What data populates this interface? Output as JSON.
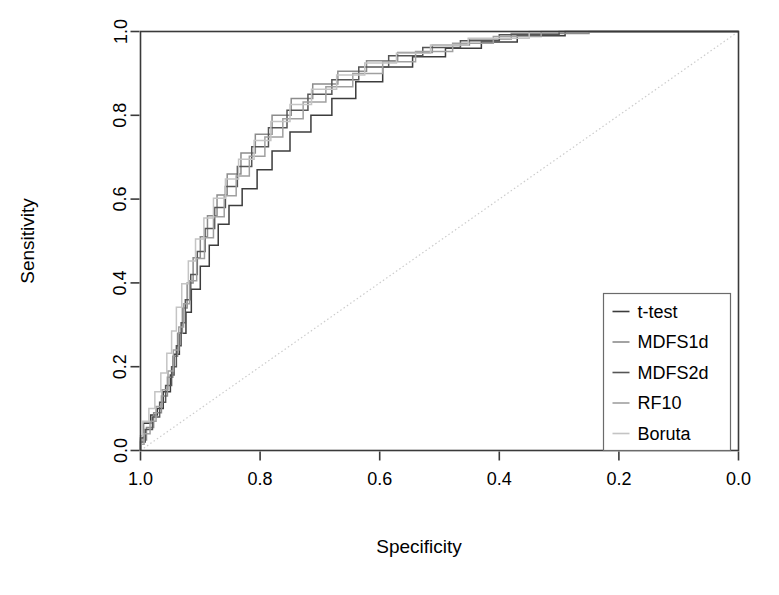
{
  "chart_data": {
    "type": "line",
    "title": "",
    "subtitle": "",
    "xlabel": "Specificity",
    "ylabel": "Sensitivity",
    "xlim": [
      1.0,
      0.0
    ],
    "ylim": [
      0.0,
      1.0
    ],
    "x_reversed": true,
    "grid": false,
    "legend_position": "bottom-right",
    "xticks": [
      "1.0",
      "0.8",
      "0.6",
      "0.4",
      "0.2",
      "0.0"
    ],
    "xtick_values": [
      1.0,
      0.8,
      0.6,
      0.4,
      0.2,
      0.0
    ],
    "yticks": [
      "0.0",
      "0.2",
      "0.4",
      "0.6",
      "0.8",
      "1.0"
    ],
    "ytick_values": [
      0.0,
      0.2,
      0.4,
      0.6,
      0.8,
      1.0
    ],
    "reference_line": {
      "name": "chance-diagonal",
      "from": [
        1.0,
        0.0
      ],
      "to": [
        0.0,
        1.0
      ],
      "style": "dotted",
      "color": "#cccccc"
    },
    "annotations": [],
    "series": [
      {
        "name": "t-test",
        "color": "#3c3c3c",
        "style": "step",
        "points": [
          [
            1.0,
            0.0
          ],
          [
            1.0,
            0.03
          ],
          [
            0.995,
            0.03
          ],
          [
            0.995,
            0.065
          ],
          [
            0.983,
            0.065
          ],
          [
            0.983,
            0.085
          ],
          [
            0.972,
            0.085
          ],
          [
            0.972,
            0.1
          ],
          [
            0.962,
            0.1
          ],
          [
            0.962,
            0.14
          ],
          [
            0.95,
            0.14
          ],
          [
            0.95,
            0.18
          ],
          [
            0.944,
            0.18
          ],
          [
            0.944,
            0.23
          ],
          [
            0.935,
            0.23
          ],
          [
            0.935,
            0.28
          ],
          [
            0.924,
            0.28
          ],
          [
            0.924,
            0.33
          ],
          [
            0.915,
            0.33
          ],
          [
            0.915,
            0.385
          ],
          [
            0.9,
            0.385
          ],
          [
            0.9,
            0.44
          ],
          [
            0.885,
            0.44
          ],
          [
            0.885,
            0.49
          ],
          [
            0.87,
            0.49
          ],
          [
            0.87,
            0.54
          ],
          [
            0.852,
            0.54
          ],
          [
            0.852,
            0.585
          ],
          [
            0.83,
            0.585
          ],
          [
            0.83,
            0.625
          ],
          [
            0.805,
            0.625
          ],
          [
            0.805,
            0.67
          ],
          [
            0.78,
            0.67
          ],
          [
            0.78,
            0.715
          ],
          [
            0.75,
            0.715
          ],
          [
            0.75,
            0.76
          ],
          [
            0.715,
            0.76
          ],
          [
            0.715,
            0.8
          ],
          [
            0.68,
            0.8
          ],
          [
            0.68,
            0.84
          ],
          [
            0.64,
            0.84
          ],
          [
            0.64,
            0.88
          ],
          [
            0.595,
            0.88
          ],
          [
            0.595,
            0.915
          ],
          [
            0.545,
            0.915
          ],
          [
            0.545,
            0.94
          ],
          [
            0.49,
            0.94
          ],
          [
            0.49,
            0.96
          ],
          [
            0.43,
            0.96
          ],
          [
            0.43,
            0.975
          ],
          [
            0.37,
            0.975
          ],
          [
            0.37,
            0.99
          ],
          [
            0.29,
            0.99
          ],
          [
            0.29,
            1.0
          ],
          [
            0.0,
            1.0
          ]
        ]
      },
      {
        "name": "MDFS1d",
        "color": "#8c8c8c",
        "style": "step",
        "points": [
          [
            1.0,
            0.0
          ],
          [
            1.0,
            0.025
          ],
          [
            0.99,
            0.025
          ],
          [
            0.99,
            0.055
          ],
          [
            0.978,
            0.055
          ],
          [
            0.978,
            0.09
          ],
          [
            0.965,
            0.09
          ],
          [
            0.965,
            0.13
          ],
          [
            0.955,
            0.13
          ],
          [
            0.955,
            0.175
          ],
          [
            0.946,
            0.175
          ],
          [
            0.946,
            0.225
          ],
          [
            0.938,
            0.225
          ],
          [
            0.938,
            0.28
          ],
          [
            0.93,
            0.28
          ],
          [
            0.93,
            0.34
          ],
          [
            0.922,
            0.34
          ],
          [
            0.922,
            0.4
          ],
          [
            0.912,
            0.4
          ],
          [
            0.912,
            0.46
          ],
          [
            0.9,
            0.46
          ],
          [
            0.9,
            0.51
          ],
          [
            0.888,
            0.51
          ],
          [
            0.888,
            0.56
          ],
          [
            0.872,
            0.56
          ],
          [
            0.872,
            0.61
          ],
          [
            0.855,
            0.61
          ],
          [
            0.855,
            0.66
          ],
          [
            0.832,
            0.66
          ],
          [
            0.832,
            0.71
          ],
          [
            0.808,
            0.71
          ],
          [
            0.808,
            0.755
          ],
          [
            0.78,
            0.755
          ],
          [
            0.78,
            0.8
          ],
          [
            0.748,
            0.8
          ],
          [
            0.748,
            0.84
          ],
          [
            0.712,
            0.84
          ],
          [
            0.712,
            0.875
          ],
          [
            0.67,
            0.875
          ],
          [
            0.67,
            0.905
          ],
          [
            0.622,
            0.905
          ],
          [
            0.622,
            0.93
          ],
          [
            0.57,
            0.93
          ],
          [
            0.57,
            0.95
          ],
          [
            0.512,
            0.95
          ],
          [
            0.512,
            0.968
          ],
          [
            0.45,
            0.968
          ],
          [
            0.45,
            0.982
          ],
          [
            0.38,
            0.982
          ],
          [
            0.38,
            0.995
          ],
          [
            0.25,
            0.995
          ],
          [
            0.25,
            1.0
          ],
          [
            0.0,
            1.0
          ]
        ]
      },
      {
        "name": "MDFS2d",
        "color": "#555555",
        "style": "step",
        "points": [
          [
            1.0,
            0.0
          ],
          [
            1.0,
            0.02
          ],
          [
            0.992,
            0.02
          ],
          [
            0.992,
            0.05
          ],
          [
            0.98,
            0.05
          ],
          [
            0.98,
            0.08
          ],
          [
            0.968,
            0.08
          ],
          [
            0.968,
            0.115
          ],
          [
            0.958,
            0.115
          ],
          [
            0.958,
            0.155
          ],
          [
            0.948,
            0.155
          ],
          [
            0.948,
            0.2
          ],
          [
            0.94,
            0.2
          ],
          [
            0.94,
            0.25
          ],
          [
            0.932,
            0.25
          ],
          [
            0.932,
            0.305
          ],
          [
            0.925,
            0.305
          ],
          [
            0.925,
            0.36
          ],
          [
            0.916,
            0.36
          ],
          [
            0.916,
            0.42
          ],
          [
            0.905,
            0.42
          ],
          [
            0.905,
            0.475
          ],
          [
            0.892,
            0.475
          ],
          [
            0.892,
            0.53
          ],
          [
            0.876,
            0.53
          ],
          [
            0.876,
            0.58
          ],
          [
            0.858,
            0.58
          ],
          [
            0.858,
            0.63
          ],
          [
            0.838,
            0.63
          ],
          [
            0.838,
            0.678
          ],
          [
            0.814,
            0.678
          ],
          [
            0.814,
            0.725
          ],
          [
            0.786,
            0.725
          ],
          [
            0.786,
            0.77
          ],
          [
            0.755,
            0.77
          ],
          [
            0.755,
            0.812
          ],
          [
            0.72,
            0.812
          ],
          [
            0.72,
            0.85
          ],
          [
            0.68,
            0.85
          ],
          [
            0.68,
            0.885
          ],
          [
            0.635,
            0.885
          ],
          [
            0.635,
            0.915
          ],
          [
            0.585,
            0.915
          ],
          [
            0.585,
            0.942
          ],
          [
            0.528,
            0.942
          ],
          [
            0.528,
            0.962
          ],
          [
            0.465,
            0.962
          ],
          [
            0.465,
            0.978
          ],
          [
            0.4,
            0.978
          ],
          [
            0.4,
            0.992
          ],
          [
            0.3,
            0.992
          ],
          [
            0.3,
            1.0
          ],
          [
            0.0,
            1.0
          ]
        ]
      },
      {
        "name": "RF10",
        "color": "#a0a0a0",
        "style": "step",
        "points": [
          [
            1.0,
            0.0
          ],
          [
            1.0,
            0.015
          ],
          [
            0.994,
            0.015
          ],
          [
            0.994,
            0.04
          ],
          [
            0.984,
            0.04
          ],
          [
            0.984,
            0.07
          ],
          [
            0.974,
            0.07
          ],
          [
            0.974,
            0.105
          ],
          [
            0.964,
            0.105
          ],
          [
            0.964,
            0.145
          ],
          [
            0.954,
            0.145
          ],
          [
            0.954,
            0.19
          ],
          [
            0.945,
            0.19
          ],
          [
            0.945,
            0.24
          ],
          [
            0.936,
            0.24
          ],
          [
            0.936,
            0.295
          ],
          [
            0.928,
            0.295
          ],
          [
            0.928,
            0.35
          ],
          [
            0.918,
            0.35
          ],
          [
            0.918,
            0.405
          ],
          [
            0.906,
            0.405
          ],
          [
            0.906,
            0.458
          ],
          [
            0.893,
            0.458
          ],
          [
            0.893,
            0.508
          ],
          [
            0.878,
            0.508
          ],
          [
            0.878,
            0.558
          ],
          [
            0.86,
            0.558
          ],
          [
            0.86,
            0.608
          ],
          [
            0.84,
            0.608
          ],
          [
            0.84,
            0.655
          ],
          [
            0.818,
            0.655
          ],
          [
            0.818,
            0.702
          ],
          [
            0.792,
            0.702
          ],
          [
            0.792,
            0.748
          ],
          [
            0.762,
            0.748
          ],
          [
            0.762,
            0.792
          ],
          [
            0.728,
            0.792
          ],
          [
            0.728,
            0.832
          ],
          [
            0.69,
            0.832
          ],
          [
            0.69,
            0.868
          ],
          [
            0.645,
            0.868
          ],
          [
            0.645,
            0.9
          ],
          [
            0.595,
            0.9
          ],
          [
            0.595,
            0.928
          ],
          [
            0.54,
            0.928
          ],
          [
            0.54,
            0.952
          ],
          [
            0.478,
            0.952
          ],
          [
            0.478,
            0.972
          ],
          [
            0.41,
            0.972
          ],
          [
            0.41,
            0.988
          ],
          [
            0.33,
            0.988
          ],
          [
            0.33,
            1.0
          ],
          [
            0.0,
            1.0
          ]
        ]
      },
      {
        "name": "Boruta",
        "color": "#c4c4c4",
        "style": "step",
        "points": [
          [
            1.0,
            0.0
          ],
          [
            1.0,
            0.035
          ],
          [
            0.996,
            0.035
          ],
          [
            0.996,
            0.07
          ],
          [
            0.986,
            0.07
          ],
          [
            0.986,
            0.1
          ],
          [
            0.976,
            0.1
          ],
          [
            0.976,
            0.14
          ],
          [
            0.966,
            0.14
          ],
          [
            0.966,
            0.185
          ],
          [
            0.956,
            0.185
          ],
          [
            0.956,
            0.232
          ],
          [
            0.948,
            0.232
          ],
          [
            0.948,
            0.285
          ],
          [
            0.94,
            0.285
          ],
          [
            0.94,
            0.342
          ],
          [
            0.931,
            0.342
          ],
          [
            0.931,
            0.398
          ],
          [
            0.92,
            0.398
          ],
          [
            0.92,
            0.452
          ],
          [
            0.908,
            0.452
          ],
          [
            0.908,
            0.505
          ],
          [
            0.894,
            0.505
          ],
          [
            0.894,
            0.555
          ],
          [
            0.878,
            0.555
          ],
          [
            0.878,
            0.602
          ],
          [
            0.858,
            0.602
          ],
          [
            0.858,
            0.648
          ],
          [
            0.836,
            0.648
          ],
          [
            0.836,
            0.695
          ],
          [
            0.81,
            0.695
          ],
          [
            0.81,
            0.74
          ],
          [
            0.782,
            0.74
          ],
          [
            0.782,
            0.785
          ],
          [
            0.75,
            0.785
          ],
          [
            0.75,
            0.826
          ],
          [
            0.714,
            0.826
          ],
          [
            0.714,
            0.862
          ],
          [
            0.672,
            0.862
          ],
          [
            0.672,
            0.896
          ],
          [
            0.625,
            0.896
          ],
          [
            0.625,
            0.925
          ],
          [
            0.572,
            0.925
          ],
          [
            0.572,
            0.948
          ],
          [
            0.515,
            0.948
          ],
          [
            0.515,
            0.968
          ],
          [
            0.452,
            0.968
          ],
          [
            0.452,
            0.984
          ],
          [
            0.35,
            0.984
          ],
          [
            0.35,
            1.0
          ],
          [
            0.0,
            1.0
          ]
        ]
      }
    ]
  },
  "legend": {
    "items": [
      {
        "label": "t-test",
        "color": "#3c3c3c"
      },
      {
        "label": "MDFS1d",
        "color": "#8c8c8c"
      },
      {
        "label": "MDFS2d",
        "color": "#555555"
      },
      {
        "label": "RF10",
        "color": "#a0a0a0"
      },
      {
        "label": "Boruta",
        "color": "#c4c4c4"
      }
    ]
  },
  "colors": {
    "axis": "#3a3a3a",
    "text": "#000000",
    "background": "#ffffff",
    "reference_line": "#cccccc",
    "legend_border": "#6b6b6b"
  }
}
